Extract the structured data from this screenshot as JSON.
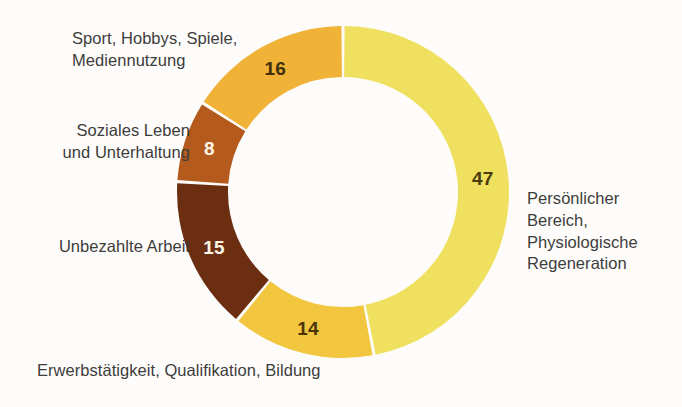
{
  "chart_data": {
    "type": "pie",
    "variant": "donut",
    "title": "",
    "subtitle": "",
    "xlabel": "",
    "ylabel": "",
    "legend_position": "around-slices",
    "grid": false,
    "units": "percent",
    "total": 100,
    "start_angle_deg": 0,
    "direction": "clockwise",
    "categories": [
      "Persönlicher Bereich, Physiologische Regeneration",
      "Erwerbstätigkeit, Qualifikation, Bildung",
      "Unbezahlte Arbeit",
      "Soziales Leben und Unterhaltung",
      "Sport, Hobbys, Spiele, Mediennutzung"
    ],
    "values": [
      47,
      14,
      15,
      8,
      16
    ],
    "colors": [
      "#efe05f",
      "#f3c63f",
      "#6b2e11",
      "#b35a1c",
      "#f0b237"
    ],
    "slices": [
      {
        "label": "Persönlicher Bereich, Physiologische Regeneration",
        "label_lines": "Persönlicher\nBereich,\nPhysiologische\nRegeneration",
        "value": 47,
        "value_text": "47",
        "color": "#efe05f",
        "value_color": "#4a3c0c"
      },
      {
        "label": "Erwerbstätigkeit, Qualifikation, Bildung",
        "label_lines": "Erwerbstätigkeit, Qualifikation, Bildung",
        "value": 14,
        "value_text": "14",
        "color": "#f3c63f",
        "value_color": "#4a3508"
      },
      {
        "label": "Unbezahlte Arbeit",
        "label_lines": "Unbezahlte Arbeit",
        "value": 15,
        "value_text": "15",
        "color": "#6b2e11",
        "value_color": "#fdf6e6"
      },
      {
        "label": "Soziales Leben und Unterhaltung",
        "label_lines": "Soziales Leben\nund Unterhaltung",
        "value": 8,
        "value_text": "8",
        "color": "#b35a1c",
        "value_color": "#fdf6e6"
      },
      {
        "label": "Sport, Hobbys, Spiele, Mediennutzung",
        "label_lines": "Sport, Hobbys, Spiele,\nMediennutzung",
        "value": 16,
        "value_text": "16",
        "color": "#f0b237",
        "value_color": "#40300a"
      }
    ]
  },
  "style": {
    "background": "#fdfcfa",
    "label_color": "#3d3d3b",
    "separator_color": "#ffffff",
    "center_x": 343,
    "center_y": 192,
    "outer_radius": 166,
    "inner_radius": 115
  }
}
